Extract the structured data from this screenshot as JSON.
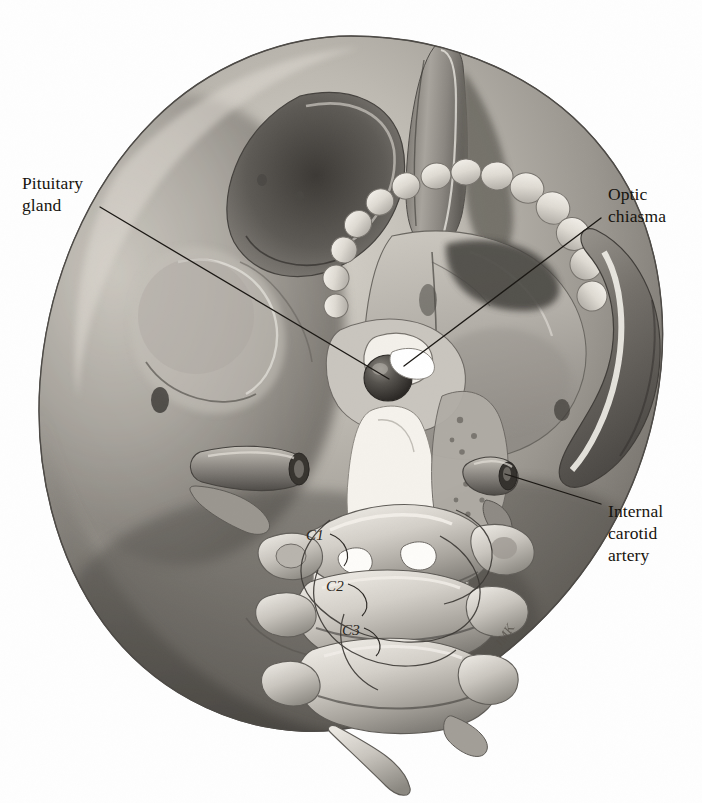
{
  "figure": {
    "medium": "graphite pencil illustration",
    "background_color": "#fefefe",
    "ink_color": "#17140f",
    "width": 702,
    "height": 803
  },
  "labels": [
    {
      "id": "pituitary-gland",
      "text": "Pituitary\ngland",
      "side": "left",
      "x": 22,
      "y": 172,
      "leader": {
        "x1": 100,
        "y1": 207,
        "x2": 389,
        "y2": 379
      }
    },
    {
      "id": "optic-chiasma",
      "text": "Optic\nchiasma",
      "side": "right",
      "x": 608,
      "y": 183,
      "leader": {
        "x1": 601,
        "y1": 218,
        "x2": 404,
        "y2": 366
      }
    },
    {
      "id": "internal-carotid-artery",
      "text": "Internal\ncarotid\nartery",
      "side": "right",
      "x": 608,
      "y": 500,
      "leader": {
        "x1": 601,
        "y1": 504,
        "x2": 505,
        "y2": 474
      }
    }
  ],
  "vertebrae": [
    {
      "id": "c1",
      "label": "C1",
      "x": 306,
      "y": 527
    },
    {
      "id": "c2",
      "label": "C2",
      "x": 326,
      "y": 578
    },
    {
      "id": "c3",
      "label": "C3",
      "x": 342,
      "y": 622
    }
  ],
  "signature": {
    "text": "JMK",
    "x": 492,
    "y": 628
  },
  "structures": [
    "cranial vault",
    "nasal septum / vomer",
    "hard palate",
    "maxillary teeth",
    "zygomatic arch",
    "sella turcica",
    "pituitary gland",
    "optic chiasma",
    "internal carotid artery",
    "styloid process",
    "foramen magnum",
    "atlas (C1)",
    "axis (C2)",
    "third cervical vertebra (C3)"
  ],
  "accent_colors": {
    "bone_light": "#e9e5dd",
    "bone_mid": "#b4b0a9",
    "bone_shadow": "#6e6a64",
    "deep_shadow": "#3a3732",
    "tooth_highlight": "#f4f1ea"
  }
}
